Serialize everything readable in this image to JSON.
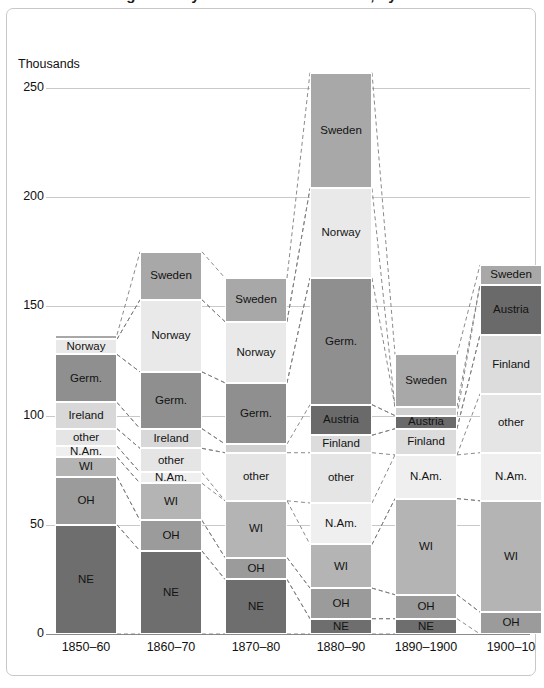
{
  "title": "Immigration by source and destination, by decade",
  "axis": {
    "unit_label": "Thousands",
    "ticks": [
      "250",
      "200",
      "150",
      "100",
      "50",
      "0"
    ],
    "tick_values": [
      250,
      200,
      150,
      100,
      50,
      0
    ],
    "ymin": 0,
    "ymax": 275
  },
  "colors": {
    "ne": "#6e6e6e",
    "oh": "#9b9b9b",
    "wi": "#b4b4b4",
    "nam": "#efefef",
    "other": "#e5e5e5",
    "ireland": "#d8d8d8",
    "germ": "#8f8f8f",
    "norway": "#e9e9e9",
    "sweden": "#a8a8a8",
    "austria": "#6a6a6a",
    "finland": "#dcdcdc",
    "thin": "#d0d0d0",
    "grid": "#c9c9c9",
    "baseline": "#8a8a8a",
    "frame": "#c8c8c8",
    "connector": "#7d7d7d"
  },
  "chart_data": {
    "type": "bar",
    "title": "Immigration by source and destination, by decade",
    "subtype": "stacked",
    "xlabel": "",
    "ylabel": "Thousands",
    "ylim": [
      0,
      275
    ],
    "grid": true,
    "legend": "none (in-bar labels)",
    "categories": [
      "1850–60",
      "1860–70",
      "1870–80",
      "1880–90",
      "1890–1900",
      "1900–10"
    ],
    "totals": [
      137,
      175,
      163,
      257,
      128,
      169
    ],
    "series": [
      {
        "name": "NE",
        "key": "ne",
        "values": [
          50,
          38,
          25,
          7,
          7,
          0
        ]
      },
      {
        "name": "OH",
        "key": "oh",
        "values": [
          22,
          14,
          10,
          14,
          11,
          10
        ]
      },
      {
        "name": "WI",
        "key": "wi",
        "values": [
          9,
          17,
          26,
          20,
          44,
          51
        ]
      },
      {
        "name": "N.Am.",
        "key": "nam",
        "values": [
          5,
          5,
          0,
          19,
          20,
          22
        ]
      },
      {
        "name": "other",
        "key": "other",
        "values": [
          8,
          11,
          22,
          23,
          0,
          27
        ]
      },
      {
        "name": "Ireland",
        "key": "ireland",
        "values": [
          12,
          9,
          4,
          0,
          0,
          0
        ]
      },
      {
        "name": "Finland",
        "key": "finland",
        "values": [
          0,
          0,
          0,
          8,
          12,
          27
        ]
      },
      {
        "name": "Austria",
        "key": "austria",
        "values": [
          0,
          0,
          0,
          14,
          6,
          23
        ]
      },
      {
        "name": "Germ.",
        "key": "germ",
        "values": [
          22,
          26,
          28,
          58,
          4,
          0
        ]
      },
      {
        "name": "Norway",
        "key": "norway",
        "values": [
          7,
          33,
          28,
          41,
          0,
          0
        ]
      },
      {
        "name": "Sweden",
        "key": "sweden",
        "values": [
          2,
          22,
          20,
          53,
          24,
          9
        ]
      }
    ]
  },
  "bars": [
    {
      "label": "1850–60",
      "x": 55,
      "segments": [
        {
          "name": "NE",
          "label": "NE",
          "value": 50,
          "color_key": "ne",
          "show_label": true
        },
        {
          "name": "OH",
          "label": "OH",
          "value": 22,
          "color_key": "oh",
          "show_label": true
        },
        {
          "name": "WI",
          "label": "WI",
          "value": 9,
          "color_key": "wi",
          "show_label": true
        },
        {
          "name": "N.Am.",
          "label": "N.Am.",
          "value": 5,
          "color_key": "nam",
          "show_label": true
        },
        {
          "name": "other",
          "label": "other",
          "value": 8,
          "color_key": "other",
          "show_label": true
        },
        {
          "name": "Ireland",
          "label": "Ireland",
          "value": 12,
          "color_key": "ireland",
          "show_label": true
        },
        {
          "name": "Germ.",
          "label": "Germ.",
          "value": 22,
          "color_key": "germ",
          "show_label": true
        },
        {
          "name": "Norway",
          "label": "Norway",
          "value": 7,
          "color_key": "norway",
          "show_label": true
        },
        {
          "name": "Sweden",
          "label": "",
          "value": 2,
          "color_key": "sweden",
          "show_label": false
        }
      ]
    },
    {
      "label": "1860–70",
      "x": 140,
      "segments": [
        {
          "name": "NE",
          "label": "NE",
          "value": 38,
          "color_key": "ne",
          "show_label": true
        },
        {
          "name": "OH",
          "label": "OH",
          "value": 14,
          "color_key": "oh",
          "show_label": true
        },
        {
          "name": "WI",
          "label": "WI",
          "value": 17,
          "color_key": "wi",
          "show_label": true
        },
        {
          "name": "N.Am.",
          "label": "N.Am.",
          "value": 5,
          "color_key": "nam",
          "show_label": true
        },
        {
          "name": "other",
          "label": "other",
          "value": 11,
          "color_key": "other",
          "show_label": true
        },
        {
          "name": "Ireland",
          "label": "Ireland",
          "value": 9,
          "color_key": "ireland",
          "show_label": true
        },
        {
          "name": "Germ.",
          "label": "Germ.",
          "value": 26,
          "color_key": "germ",
          "show_label": true
        },
        {
          "name": "Norway",
          "label": "Norway",
          "value": 33,
          "color_key": "norway",
          "show_label": true
        },
        {
          "name": "Sweden",
          "label": "Sweden",
          "value": 22,
          "color_key": "sweden",
          "show_label": true
        }
      ]
    },
    {
      "label": "1870–80",
      "x": 225,
      "segments": [
        {
          "name": "NE",
          "label": "NE",
          "value": 25,
          "color_key": "ne",
          "show_label": true
        },
        {
          "name": "OH",
          "label": "OH",
          "value": 10,
          "color_key": "oh",
          "show_label": true
        },
        {
          "name": "WI",
          "label": "WI",
          "value": 26,
          "color_key": "wi",
          "show_label": true
        },
        {
          "name": "other",
          "label": "other",
          "value": 22,
          "color_key": "other",
          "show_label": true
        },
        {
          "name": "Ireland",
          "label": "",
          "value": 4,
          "color_key": "thin",
          "show_label": false
        },
        {
          "name": "Germ.",
          "label": "Germ.",
          "value": 28,
          "color_key": "germ",
          "show_label": true
        },
        {
          "name": "Norway",
          "label": "Norway",
          "value": 28,
          "color_key": "norway",
          "show_label": true
        },
        {
          "name": "Sweden",
          "label": "Sweden",
          "value": 20,
          "color_key": "sweden",
          "show_label": true
        }
      ]
    },
    {
      "label": "1880–90",
      "x": 310,
      "segments": [
        {
          "name": "NE",
          "label": "NE",
          "value": 7,
          "color_key": "ne",
          "show_label": true
        },
        {
          "name": "OH",
          "label": "OH",
          "value": 14,
          "color_key": "oh",
          "show_label": true
        },
        {
          "name": "WI",
          "label": "WI",
          "value": 20,
          "color_key": "wi",
          "show_label": true
        },
        {
          "name": "N.Am.",
          "label": "N.Am.",
          "value": 19,
          "color_key": "nam",
          "show_label": true
        },
        {
          "name": "other",
          "label": "other",
          "value": 23,
          "color_key": "other",
          "show_label": true
        },
        {
          "name": "Finland",
          "label": "Finland",
          "value": 8,
          "color_key": "finland",
          "show_label": true
        },
        {
          "name": "Austria",
          "label": "Austria",
          "value": 14,
          "color_key": "austria",
          "show_label": true
        },
        {
          "name": "Germ.",
          "label": "Germ.",
          "value": 58,
          "color_key": "germ",
          "show_label": true
        },
        {
          "name": "Norway",
          "label": "Norway",
          "value": 41,
          "color_key": "norway",
          "show_label": true
        },
        {
          "name": "Sweden",
          "label": "Sweden",
          "value": 53,
          "color_key": "sweden",
          "show_label": true
        }
      ]
    },
    {
      "label": "1890–1900",
      "x": 395,
      "segments": [
        {
          "name": "NE",
          "label": "NE",
          "value": 7,
          "color_key": "ne",
          "show_label": true
        },
        {
          "name": "OH",
          "label": "OH",
          "value": 11,
          "color_key": "oh",
          "show_label": true
        },
        {
          "name": "WI",
          "label": "WI",
          "value": 44,
          "color_key": "wi",
          "show_label": true
        },
        {
          "name": "N.Am.",
          "label": "N.Am.",
          "value": 20,
          "color_key": "nam",
          "show_label": true
        },
        {
          "name": "Finland",
          "label": "Finland",
          "value": 12,
          "color_key": "finland",
          "show_label": true
        },
        {
          "name": "Austria",
          "label": "Austria",
          "value": 6,
          "color_key": "austria",
          "show_label": true
        },
        {
          "name": "Germ.",
          "label": "",
          "value": 4,
          "color_key": "thin",
          "show_label": false
        },
        {
          "name": "Sweden",
          "label": "Sweden",
          "value": 24,
          "color_key": "sweden",
          "show_label": true
        }
      ]
    },
    {
      "label": "1900–10",
      "x": 480,
      "segments": [
        {
          "name": "OH",
          "label": "OH",
          "value": 10,
          "color_key": "oh",
          "show_label": true
        },
        {
          "name": "WI",
          "label": "WI",
          "value": 51,
          "color_key": "wi",
          "show_label": true
        },
        {
          "name": "N.Am.",
          "label": "N.Am.",
          "value": 22,
          "color_key": "nam",
          "show_label": true
        },
        {
          "name": "other",
          "label": "other",
          "value": 27,
          "color_key": "other",
          "show_label": true
        },
        {
          "name": "Finland",
          "label": "Finland",
          "value": 27,
          "color_key": "finland",
          "show_label": true
        },
        {
          "name": "Austria",
          "label": "Austria",
          "value": 23,
          "color_key": "austria",
          "show_label": true
        },
        {
          "name": "Sweden",
          "label": "Sweden",
          "value": 9,
          "color_key": "sweden",
          "show_label": true
        }
      ]
    }
  ]
}
